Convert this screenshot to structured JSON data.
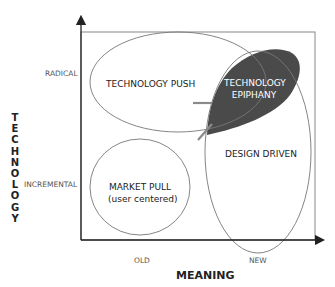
{
  "diagram": {
    "y_axis": {
      "title": "TECHNOLOGY",
      "title_letters": [
        "T",
        "E",
        "C",
        "H",
        "N",
        "O",
        "L",
        "O",
        "G",
        "Y"
      ],
      "ticks": {
        "top": "RADICAL",
        "bottom": "INCREMENTAL"
      }
    },
    "x_axis": {
      "title": "MEANING",
      "ticks": {
        "left": "OLD",
        "right": "NEW"
      }
    },
    "regions": {
      "technology_push": "TECHNOLOGY PUSH",
      "technology_epiphany_line1": "TECHNOLOGY",
      "technology_epiphany_line2": "EPIPHANY",
      "design_driven": "DESIGN DRIVEN",
      "market_pull_line1": "MARKET PULL",
      "market_pull_line2": "(user centered)"
    },
    "colors": {
      "epiphany_fill": "#4a4a4a",
      "axis": "#222222",
      "outline": "#777777",
      "arrow_accent": "#8a8a8a"
    }
  }
}
